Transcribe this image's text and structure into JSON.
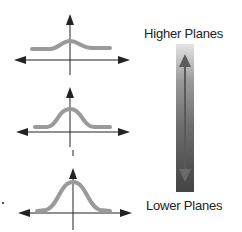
{
  "labels": {
    "top": "Higher Planes",
    "bottom": "Lower Planes"
  },
  "plots": [
    {
      "position": "top",
      "curve": "low flat bell curve",
      "peak_height": "small"
    },
    {
      "position": "middle",
      "curve": "medium bell curve",
      "peak_height": "medium"
    },
    {
      "position": "bottom",
      "curve": "tall narrow bell curve",
      "peak_height": "large"
    }
  ],
  "gradient_bar": {
    "direction": "vertical",
    "top_color": "#e4e4e4",
    "bottom_color": "#444444",
    "arrow": "double-headed vertical"
  },
  "colors": {
    "curve": "#9a9a9a",
    "axis": "#222222"
  }
}
